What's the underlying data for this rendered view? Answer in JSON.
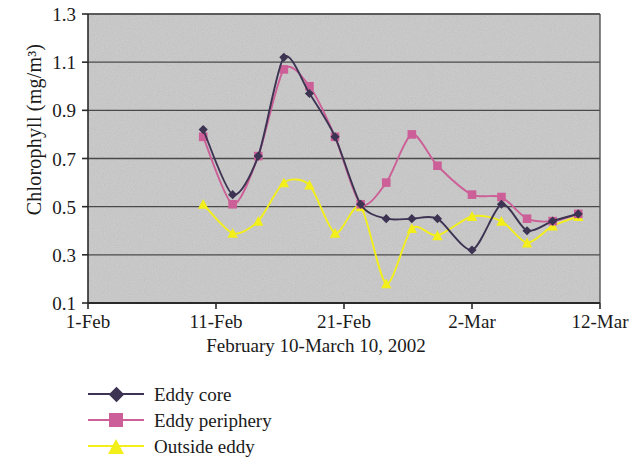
{
  "chart_data": {
    "type": "line",
    "title": "",
    "xlabel": "February 10-March 10, 2002",
    "ylabel": "Chlorophyll (mg/m³)",
    "ylim": [
      0.1,
      1.3
    ],
    "yticks": [
      "0.1",
      "0.3",
      "0.5",
      "0.7",
      "0.9",
      "1.1",
      "1.3"
    ],
    "ytick_values": [
      0.1,
      0.3,
      0.5,
      0.7,
      0.9,
      1.1,
      1.3
    ],
    "xticks": [
      "1-Feb",
      "11-Feb",
      "21-Feb",
      "2-Mar",
      "12-Mar"
    ],
    "xtick_days": [
      0,
      10,
      20,
      30,
      40
    ],
    "xlim_days": [
      0,
      40
    ],
    "grid": "horizontal",
    "legend_position": "below-left",
    "plot_background": "#c9c9c9",
    "series": [
      {
        "name": "Eddy core",
        "color": "#3d3352",
        "marker": "diamond",
        "x": [
          9,
          11.3,
          13.3,
          15.3,
          17.3,
          19.3,
          21.3,
          23.3,
          25.3,
          27.3,
          30.0,
          32.3,
          34.3,
          36.3,
          38.3
        ],
        "values": [
          0.82,
          0.55,
          0.71,
          1.12,
          0.97,
          0.79,
          0.51,
          0.45,
          0.45,
          0.45,
          0.32,
          0.51,
          0.4,
          0.44,
          0.47
        ]
      },
      {
        "name": "Eddy periphery",
        "color": "#cc5f97",
        "marker": "square",
        "x": [
          9,
          11.3,
          13.3,
          15.3,
          17.3,
          19.3,
          21.3,
          23.3,
          25.3,
          27.3,
          30.0,
          32.3,
          34.3,
          36.3,
          38.3
        ],
        "values": [
          0.79,
          0.51,
          0.71,
          1.07,
          1.0,
          0.79,
          0.51,
          0.6,
          0.8,
          0.67,
          0.55,
          0.54,
          0.45,
          0.44,
          0.47
        ]
      },
      {
        "name": "Outside eddy",
        "color": "#f2ef1a",
        "marker": "triangle",
        "x": [
          9,
          11.3,
          13.3,
          15.3,
          17.3,
          19.3,
          21.3,
          23.3,
          25.3,
          27.3,
          30.0,
          32.3,
          34.3,
          36.3,
          38.3
        ],
        "values": [
          0.51,
          0.39,
          0.44,
          0.6,
          0.59,
          0.39,
          0.5,
          0.18,
          0.41,
          0.38,
          0.46,
          0.44,
          0.35,
          0.42,
          0.46
        ]
      }
    ]
  },
  "legend": {
    "items": [
      {
        "label": "Eddy core"
      },
      {
        "label": "Eddy periphery"
      },
      {
        "label": "Outside eddy"
      }
    ]
  }
}
